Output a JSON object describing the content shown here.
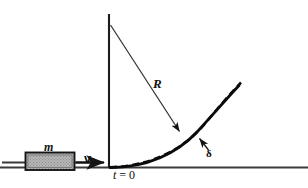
{
  "figure": {
    "background_color": "#ffffff",
    "line_color": "#1a1a1a",
    "block_fill_color": "#b3b3b3",
    "labels": {
      "radius": "R",
      "deflection": "δ",
      "mass": "m",
      "velocity": "v",
      "time_origin_t": "t",
      "time_origin_eq": " = 0",
      "time_origin_full": "t = 0"
    },
    "icons": {
      "radius_arrow": "arrow-line-icon",
      "velocity_arrow": "arrow-right-icon",
      "deflection_arrow": "arrow-pointer-icon",
      "mass_block": "hatched-rectangle-icon",
      "vertical_axis": "axis-line-icon",
      "ground_line": "horizontal-rule-icon",
      "solid_curve": "curve-icon",
      "dashed_curve": "dashed-curve-icon"
    },
    "geometry": {
      "axis_x": 109,
      "axis_top_y": 14,
      "baseline_y": 167,
      "radius_origin": [
        110,
        25
      ],
      "radius_arrow_tip": [
        180,
        132
      ],
      "block_rect": [
        25,
        152,
        50,
        18
      ],
      "curve_start": [
        110,
        167
      ],
      "curve_end": [
        240,
        84
      ]
    }
  }
}
